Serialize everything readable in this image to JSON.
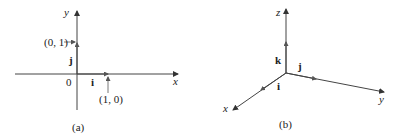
{
  "panel_a": {
    "caption": "(a)",
    "x_axis_label": "x",
    "y_axis_label": "y",
    "origin_label": "0",
    "vector_i_label": "i",
    "vector_j_label": "j",
    "point_01_label": "(0, 1)",
    "point_10_label": "(1, 0)"
  },
  "panel_b": {
    "caption": "(b)",
    "x_axis_label": "x",
    "y_axis_label": "y",
    "z_axis_label": "z",
    "vector_i_label": "i",
    "vector_j_label": "j",
    "vector_k_label": "k"
  },
  "colors": {
    "ink": "#333333"
  }
}
